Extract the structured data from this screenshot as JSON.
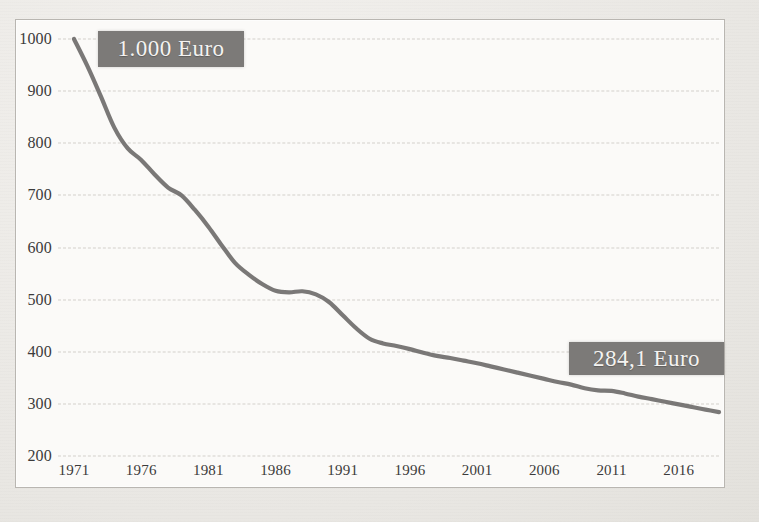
{
  "chart_data": {
    "type": "line",
    "title": "",
    "xlabel": "",
    "ylabel": "",
    "xlim": [
      1971,
      2019
    ],
    "ylim": [
      200,
      1000
    ],
    "grid": true,
    "legend": "none",
    "xticks": [
      "1971",
      "1976",
      "1981",
      "1986",
      "1991",
      "1996",
      "2001",
      "2006",
      "2011",
      "2016"
    ],
    "yticks": [
      "200",
      "300",
      "400",
      "500",
      "600",
      "700",
      "800",
      "900",
      "1000"
    ],
    "series": [
      {
        "name": "Kaufkraft",
        "color": "#6f6d6b",
        "x": [
          1971,
          1972,
          1973,
          1974,
          1975,
          1976,
          1977,
          1978,
          1979,
          1980,
          1981,
          1982,
          1983,
          1984,
          1985,
          1986,
          1987,
          1988,
          1989,
          1990,
          1991,
          1992,
          1993,
          1994,
          1995,
          1996,
          1997,
          1998,
          1999,
          2000,
          2001,
          2002,
          2003,
          2004,
          2005,
          2006,
          2007,
          2008,
          2009,
          2010,
          2011,
          2012,
          2013,
          2014,
          2015,
          2016,
          2017,
          2018,
          2019
        ],
        "values": [
          1000,
          948,
          890,
          830,
          790,
          768,
          740,
          715,
          700,
          672,
          640,
          604,
          570,
          548,
          530,
          517,
          514,
          516,
          510,
          495,
          470,
          445,
          425,
          416,
          411,
          405,
          398,
          392,
          388,
          383,
          378,
          372,
          366,
          360,
          354,
          348,
          342,
          337,
          330,
          326,
          325,
          320,
          314,
          309,
          304,
          299,
          294,
          289,
          284.1
        ]
      }
    ],
    "annotations": [
      {
        "id": "start-callout",
        "text": "1.000 Euro",
        "x": 1971,
        "y": 1000
      },
      {
        "id": "end-callout",
        "text": "284,1 Euro",
        "x": 2019,
        "y": 284.1
      }
    ]
  },
  "figure": {
    "frame_color": "#b9b6b1",
    "plot_background": "#fbfaf8",
    "page_background": "#eceae6",
    "gridline_color": "#d3d0cb",
    "callout_background": "#7c7a78",
    "callout_text_color": "#f4f3f1"
  }
}
